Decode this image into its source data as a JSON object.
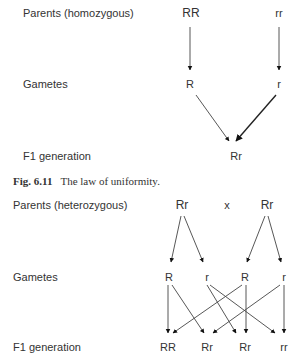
{
  "figure1": {
    "rows": {
      "parents": "Parents (homozygous)",
      "gametes": "Gametes",
      "f1": "F1 generation"
    },
    "parents": [
      "RR",
      "rr"
    ],
    "gametes": [
      "R",
      "r"
    ],
    "f1": [
      "Rr"
    ]
  },
  "caption": {
    "label": "Fig. 6.11",
    "text": "The law of uniformity."
  },
  "figure2": {
    "rows": {
      "parents": "Parents (heterozygous)",
      "gametes": "Gametes",
      "f1": "F1 generation"
    },
    "parents": [
      "Rr",
      "Rr"
    ],
    "cross_symbol": "x",
    "gametes": [
      "R",
      "r",
      "R",
      "r"
    ],
    "f1": [
      "RR",
      "Rr",
      "Rr",
      "rr"
    ]
  }
}
